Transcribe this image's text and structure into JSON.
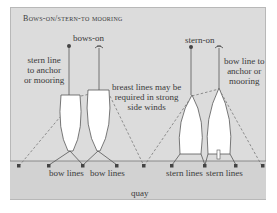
{
  "diagram": {
    "title": "Bows-on/stern-to mooring",
    "labels": {
      "bows_on": "bows-on",
      "stern_on": "stern-on",
      "stern_line_anchor": [
        "stern line",
        "to anchor",
        "or mooring"
      ],
      "bow_line_anchor": [
        "bow line to",
        "anchor or",
        "mooring"
      ],
      "breast_lines": [
        "breast lines may be",
        "required in strong",
        "side winds"
      ],
      "bow_lines_1": "bow lines",
      "bow_lines_2": "bow lines",
      "stern_lines_1": "stern lines",
      "stern_lines_2": "stern lines",
      "quay": "quay"
    },
    "colors": {
      "background": "#dcdcdc",
      "quay": "#d2d2d2",
      "line": "#555555",
      "boat": "#ffffff"
    }
  }
}
